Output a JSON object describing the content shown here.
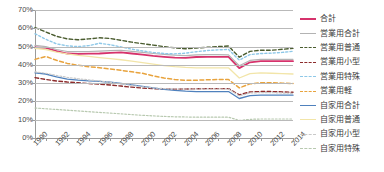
{
  "chart_data": {
    "type": "line",
    "title": "",
    "xlabel": "",
    "ylabel": "",
    "ylim": [
      0,
      70
    ],
    "ytick_labels": [
      "0%",
      "10%",
      "20%",
      "30%",
      "40%",
      "50%",
      "60%",
      "70%"
    ],
    "ytick_values": [
      0,
      10,
      20,
      30,
      40,
      50,
      60,
      70
    ],
    "grid": true,
    "legend_position": "right",
    "x": [
      1990,
      1991,
      1992,
      1993,
      1994,
      1995,
      1996,
      1997,
      1998,
      1999,
      2000,
      2001,
      2002,
      2003,
      2004,
      2005,
      2006,
      2007,
      2008,
      2009,
      2010,
      2011,
      2012,
      2013,
      2014
    ],
    "xtick_labels": [
      "1990",
      "1992",
      "1994",
      "1996",
      "1998",
      "2000",
      "2002",
      "2004",
      "2006",
      "2008",
      "2010",
      "2012",
      "2014"
    ],
    "xtick_values": [
      1990,
      1992,
      1994,
      1996,
      1998,
      2000,
      2002,
      2004,
      2006,
      2008,
      2010,
      2012,
      2014
    ],
    "series": [
      {
        "name": "合計",
        "color": "#d6336c",
        "style": "solid",
        "width": 1.8,
        "values": [
          49.5,
          49.3,
          47.5,
          46.2,
          46.0,
          46.1,
          46.2,
          46.5,
          46.8,
          46.2,
          45.6,
          44.9,
          44.4,
          44.0,
          43.8,
          44.3,
          44.4,
          44.4,
          44.4,
          38.2,
          41.4,
          42.0,
          42.0,
          42.0,
          42.0
        ]
      },
      {
        "name": "営業用合計",
        "color": "#b3b3b3",
        "style": "solid",
        "width": 1.2,
        "values": [
          50.6,
          50.0,
          48.4,
          47.3,
          47.2,
          47.3,
          47.5,
          47.8,
          48.0,
          47.4,
          46.8,
          46.2,
          45.7,
          45.3,
          45.1,
          45.5,
          45.6,
          45.6,
          45.5,
          39.5,
          42.4,
          43.0,
          43.0,
          43.0,
          43.0
        ]
      },
      {
        "name": "営業用普通",
        "color": "#4a5c2f",
        "style": "dashed",
        "width": 1.4,
        "values": [
          60.4,
          58.0,
          55.6,
          54.2,
          53.7,
          54.2,
          54.8,
          54.4,
          53.4,
          52.4,
          51.6,
          50.8,
          50.0,
          49.3,
          48.8,
          49.2,
          49.6,
          50.0,
          50.3,
          44.2,
          47.4,
          48.0,
          48.0,
          48.5,
          49.0
        ]
      },
      {
        "name": "営業用小型",
        "color": "#8c2b2b",
        "style": "dashed",
        "width": 1.4,
        "values": [
          33.0,
          32.0,
          31.2,
          30.6,
          30.2,
          29.8,
          29.4,
          29.0,
          28.4,
          27.8,
          27.3,
          27.0,
          26.8,
          26.7,
          26.8,
          26.9,
          27.0,
          27.0,
          27.0,
          23.6,
          25.2,
          25.4,
          25.4,
          25.2,
          25.0
        ]
      },
      {
        "name": "営業用特殊",
        "color": "#8ec8e8",
        "style": "dotted",
        "width": 1.4,
        "values": [
          57.0,
          54.0,
          51.5,
          50.4,
          50.0,
          50.5,
          51.8,
          51.0,
          49.8,
          48.6,
          47.6,
          46.8,
          46.2,
          46.0,
          46.4,
          47.2,
          47.8,
          48.2,
          48.4,
          42.6,
          45.6,
          46.2,
          46.4,
          46.8,
          47.4
        ]
      },
      {
        "name": "営業用軽",
        "color": "#e8a33d",
        "style": "dashed",
        "width": 1.5,
        "values": [
          43.0,
          44.6,
          42.5,
          40.8,
          39.8,
          39.0,
          38.4,
          37.7,
          37.0,
          36.2,
          35.4,
          34.0,
          32.8,
          32.0,
          31.6,
          31.6,
          31.8,
          32.0,
          32.0,
          27.4,
          29.6,
          30.2,
          30.2,
          30.0,
          29.8
        ]
      },
      {
        "name": "自家用合計",
        "color": "#4f81bd",
        "style": "solid",
        "width": 1.3,
        "values": [
          35.6,
          35.0,
          33.4,
          32.2,
          31.6,
          31.2,
          31.0,
          30.5,
          29.8,
          29.0,
          28.2,
          27.4,
          26.6,
          26.0,
          25.6,
          25.4,
          25.4,
          25.4,
          25.4,
          21.6,
          23.2,
          23.4,
          23.4,
          23.4,
          23.4
        ]
      },
      {
        "name": "自家用普通",
        "color": "#f2e5a8",
        "style": "solid",
        "width": 1.3,
        "values": [
          49.0,
          48.4,
          47.0,
          46.0,
          45.2,
          44.6,
          44.0,
          43.4,
          42.8,
          42.0,
          41.2,
          40.4,
          39.6,
          39.0,
          38.6,
          38.4,
          38.4,
          38.4,
          38.4,
          32.8,
          35.2,
          35.6,
          35.4,
          35.2,
          35.0
        ]
      },
      {
        "name": "自家用小型",
        "color": "#c9c9c9",
        "style": "dotted",
        "width": 1.2,
        "values": [
          36.2,
          35.4,
          34.2,
          33.2,
          32.4,
          31.8,
          31.2,
          30.4,
          29.6,
          28.8,
          28.0,
          27.4,
          27.0,
          26.8,
          26.8,
          26.8,
          26.8,
          26.8,
          26.8,
          23.0,
          24.6,
          24.8,
          24.8,
          24.6,
          24.4
        ]
      },
      {
        "name": "自家用特殊",
        "color": "#b8c9b0",
        "style": "dotted",
        "width": 1.2,
        "values": [
          16.4,
          16.0,
          15.6,
          15.2,
          14.8,
          14.4,
          14.0,
          13.6,
          13.2,
          12.8,
          12.4,
          12.1,
          11.8,
          11.6,
          11.5,
          11.4,
          11.4,
          11.4,
          11.4,
          9.6,
          10.2,
          10.4,
          10.4,
          10.4,
          10.4
        ]
      }
    ],
    "legend": [
      {
        "label": "合計",
        "color": "#d6336c",
        "style": "solid"
      },
      {
        "label": "営業用合計",
        "color": "#b3b3b3",
        "style": "solid"
      },
      {
        "label": "営業用普通",
        "color": "#4a5c2f",
        "style": "dashed"
      },
      {
        "label": "営業用小型",
        "color": "#8c2b2b",
        "style": "dashed"
      },
      {
        "label": "営業用特殊",
        "color": "#8ec8e8",
        "style": "dotted"
      },
      {
        "label": "営業用軽",
        "color": "#e8a33d",
        "style": "dashed"
      },
      {
        "label": "自家用合計",
        "color": "#4f81bd",
        "style": "solid"
      },
      {
        "label": "自家用普通",
        "color": "#f2e5a8",
        "style": "solid"
      },
      {
        "label": "自家用小型",
        "color": "#c9c9c9",
        "style": "dotted"
      },
      {
        "label": "自家用特殊",
        "color": "#b8c9b0",
        "style": "dotted"
      }
    ]
  }
}
